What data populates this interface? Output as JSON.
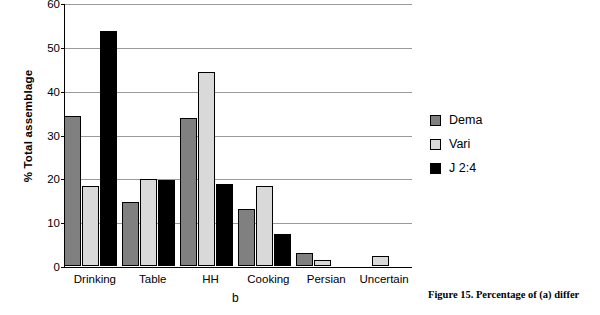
{
  "chart_data": {
    "type": "bar",
    "title": "",
    "xlabel": "",
    "ylabel": "% Total assemblage",
    "ylim": [
      0,
      60
    ],
    "yticks": [
      0,
      10,
      20,
      30,
      40,
      50,
      60
    ],
    "grid": true,
    "legend_position": "right",
    "categories": [
      "Drinking",
      "Table",
      "HH",
      "Cooking",
      "Persian",
      "Uncertain"
    ],
    "series": [
      {
        "name": "Dema",
        "color": "#808080",
        "values": [
          34.3,
          14.7,
          33.9,
          13.0,
          2.9,
          0
        ]
      },
      {
        "name": "Vari",
        "color": "#d9d9d9",
        "values": [
          18.3,
          20.0,
          44.4,
          18.4,
          1.4,
          2.3
        ]
      },
      {
        "name": "J 2:4",
        "color": "#000000",
        "values": [
          53.8,
          19.6,
          18.8,
          7.4,
          0,
          0
        ]
      }
    ]
  },
  "sub_caption": "b",
  "figure_caption": "Figure 15. Percentage of (a) differ"
}
